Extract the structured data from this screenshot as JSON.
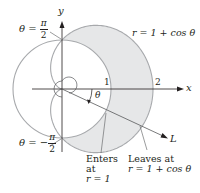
{
  "diagram": {
    "type": "polar-region",
    "origin": {
      "x": 62,
      "y": 89
    },
    "circle": {
      "equation": "r = 1",
      "radius": 1
    },
    "cardioid": {
      "equation": "r = 1 + cos θ"
    },
    "colors": {
      "curve": "#a7a9ac",
      "fill": "#e6e7e8",
      "axis": "#231f20",
      "text": "#231f20",
      "ray": "#58595b"
    }
  },
  "labels": {
    "y_axis": "y",
    "x_axis": "x",
    "tick_1": "1",
    "tick_2": "2",
    "theta": "θ",
    "ray": "L",
    "cardioid_eq": "r = 1 + cos θ",
    "theta_top": {
      "prefix": "θ = ",
      "num": "π",
      "den": "2"
    },
    "theta_bottom": {
      "prefix": "θ = −",
      "num": "π",
      "den": "2"
    },
    "enters": {
      "line1": "Enters",
      "line2": "at",
      "line3": "r = 1"
    },
    "leaves": {
      "line1": "Leaves at",
      "line2": "r = 1 + cos θ"
    }
  }
}
